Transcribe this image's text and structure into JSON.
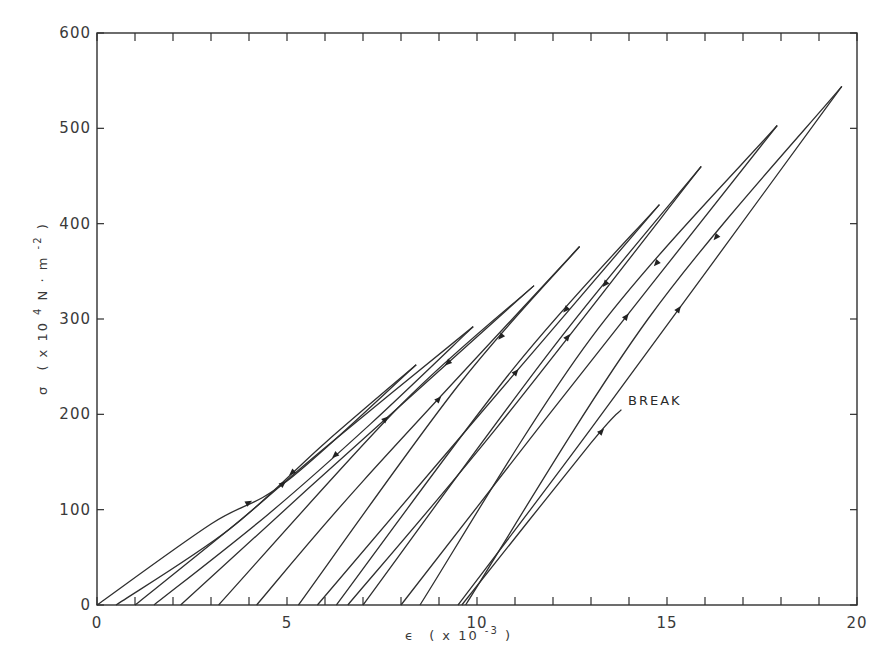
{
  "chart_data": {
    "type": "line",
    "title": "",
    "xlabel": "ε (x 10^-3)",
    "ylabel": "σ (x 10^4 N · m^-2)",
    "xlim": [
      0,
      20
    ],
    "ylim": [
      0,
      600
    ],
    "x_ticks": [
      0,
      5,
      10,
      15,
      20
    ],
    "y_ticks": [
      0,
      100,
      200,
      300,
      400,
      500,
      600
    ],
    "x_tick_labels": [
      "0",
      "5",
      "10",
      "15",
      "20"
    ],
    "y_tick_labels": [
      "0",
      "100",
      "200",
      "300",
      "400",
      "500",
      "600"
    ],
    "minor_x_ticks_every": 1,
    "grid": false,
    "legend": null,
    "annotations": [
      {
        "text": "BREAK",
        "x": 13.9,
        "y": 215
      }
    ],
    "series": [
      {
        "name": "cycle 1",
        "loading": [
          [
            0.0,
            0
          ],
          [
            3.0,
            85
          ],
          [
            5.0,
            130
          ],
          [
            8.4,
            252
          ]
        ],
        "unloading": [
          [
            8.4,
            252
          ],
          [
            6.0,
            170
          ],
          [
            3.5,
            80
          ],
          [
            0.5,
            0
          ]
        ]
      },
      {
        "name": "cycle 2",
        "loading": [
          [
            1.0,
            0
          ],
          [
            3.8,
            90
          ],
          [
            6.0,
            165
          ],
          [
            9.9,
            292
          ]
        ],
        "unloading": [
          [
            9.9,
            292
          ],
          [
            7.2,
            190
          ],
          [
            4.5,
            95
          ],
          [
            1.5,
            0
          ]
        ]
      },
      {
        "name": "cycle 3",
        "loading": [
          [
            2.2,
            0
          ],
          [
            5.5,
            120
          ],
          [
            11.5,
            335
          ]
        ],
        "unloading": [
          [
            11.5,
            335
          ],
          [
            8.0,
            210
          ],
          [
            3.2,
            0
          ]
        ]
      },
      {
        "name": "cycle 4",
        "loading": [
          [
            4.2,
            0
          ],
          [
            7.0,
            130
          ],
          [
            12.7,
            376
          ]
        ],
        "unloading": [
          [
            12.7,
            376
          ],
          [
            9.5,
            230
          ],
          [
            5.3,
            0
          ]
        ]
      },
      {
        "name": "cycle 5",
        "loading": [
          [
            5.8,
            0
          ],
          [
            9.0,
            150
          ],
          [
            14.8,
            420
          ]
        ],
        "unloading": [
          [
            14.8,
            420
          ],
          [
            11.0,
            250
          ],
          [
            6.3,
            0
          ]
        ]
      },
      {
        "name": "cycle 6",
        "loading": [
          [
            6.6,
            0
          ],
          [
            10.5,
            185
          ],
          [
            15.9,
            460
          ]
        ],
        "unloading": [
          [
            15.9,
            460
          ],
          [
            12.0,
            270
          ],
          [
            7.0,
            0
          ]
        ]
      },
      {
        "name": "cycle 7",
        "loading": [
          [
            8.0,
            0
          ],
          [
            11.8,
            195
          ],
          [
            17.9,
            503
          ]
        ],
        "unloading": [
          [
            17.9,
            503
          ],
          [
            13.0,
            280
          ],
          [
            8.5,
            0
          ]
        ]
      },
      {
        "name": "cycle 8",
        "loading": [
          [
            9.5,
            0
          ],
          [
            13.0,
            185
          ],
          [
            19.6,
            544
          ]
        ],
        "unloading": [
          [
            19.6,
            544
          ],
          [
            14.5,
            300
          ],
          [
            9.7,
            0
          ]
        ]
      },
      {
        "name": "break",
        "loading": [
          [
            9.6,
            0
          ],
          [
            13.0,
            170
          ],
          [
            13.8,
            205
          ]
        ],
        "unloading": []
      }
    ]
  },
  "axes": {
    "x_label_symbol": "ϵ",
    "x_label_rest": "( x 10",
    "x_label_exp": "-3",
    "x_label_close": ")",
    "y_label_symbol": "σ",
    "y_label_rest": "( x 10",
    "y_label_exp4": "4",
    "y_label_mid": " N · m",
    "y_label_exp2": "-2",
    "y_label_close": " )"
  },
  "annotation_break": "BREAK"
}
